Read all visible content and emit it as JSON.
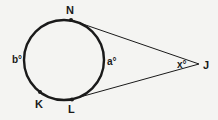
{
  "diagram": {
    "type": "circle with two tangents from external point",
    "colors": {
      "stroke": "#1a1a1a",
      "background": "#f4f4f2"
    },
    "points": {
      "N": {
        "label": "N"
      },
      "K": {
        "label": "K"
      },
      "L": {
        "label": "L"
      },
      "J": {
        "label": "J"
      }
    },
    "arc_labels": {
      "minor_arc": "a°",
      "major_arc": "b°"
    },
    "angle_label": "x°"
  }
}
